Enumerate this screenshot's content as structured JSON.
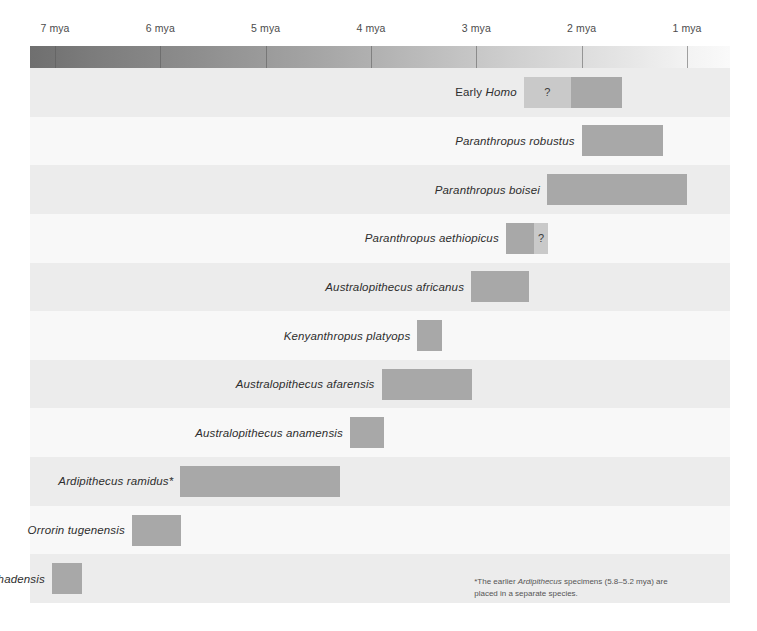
{
  "chart_data": {
    "type": "bar",
    "xlabel": "Millions of years ago (mya)",
    "ylabel": "",
    "xlim": [
      7.25,
      0.75
    ],
    "x_direction": "decreasing",
    "grid": true,
    "legend": "none",
    "axis_ticks": [
      {
        "value": 7,
        "label": "7 mya"
      },
      {
        "value": 6,
        "label": "6 mya"
      },
      {
        "value": 5,
        "label": "5 mya"
      },
      {
        "value": 4,
        "label": "4 mya"
      },
      {
        "value": 3,
        "label": "3 mya"
      },
      {
        "value": 2,
        "label": "2 mya"
      },
      {
        "value": 1,
        "label": "1 mya"
      }
    ],
    "series": [
      {
        "name": "Early Homo",
        "label_prefix": "Early ",
        "label_italic": "Homo",
        "label_full": "Early Homo",
        "label_align": "right-of-label",
        "ranges": [
          {
            "start": 2.55,
            "end": 2.1,
            "uncertain": true,
            "marker": "?"
          },
          {
            "start": 2.1,
            "end": 1.62,
            "uncertain": false,
            "marker": ""
          }
        ]
      },
      {
        "name": "Paranthropus robustus",
        "label_prefix": "",
        "label_italic": "Paranthropus robustus",
        "label_full": "Paranthropus robustus",
        "ranges": [
          {
            "start": 2.0,
            "end": 1.23,
            "uncertain": false,
            "marker": ""
          }
        ]
      },
      {
        "name": "Paranthropus boisei",
        "label_prefix": "",
        "label_italic": "Paranthropus boisei",
        "label_full": "Paranthropus boisei",
        "ranges": [
          {
            "start": 2.33,
            "end": 1.0,
            "uncertain": false,
            "marker": ""
          }
        ]
      },
      {
        "name": "Paranthropus aethiopicus",
        "label_prefix": "",
        "label_italic": "Paranthropus aethiopicus",
        "label_full": "Paranthropus aethiopicus",
        "ranges": [
          {
            "start": 2.72,
            "end": 2.45,
            "uncertain": false,
            "marker": ""
          },
          {
            "start": 2.45,
            "end": 2.32,
            "uncertain": true,
            "marker": "?"
          }
        ]
      },
      {
        "name": "Australopithecus africanus",
        "label_prefix": "",
        "label_italic": "Australopithecus africanus",
        "label_full": "Australopithecus africanus",
        "ranges": [
          {
            "start": 3.05,
            "end": 2.5,
            "uncertain": false,
            "marker": ""
          }
        ]
      },
      {
        "name": "Kenyanthropus platyops",
        "label_prefix": "",
        "label_italic": "Kenyanthropus platyops",
        "label_full": "Kenyanthropus platyops",
        "ranges": [
          {
            "start": 3.56,
            "end": 3.33,
            "uncertain": false,
            "marker": ""
          }
        ]
      },
      {
        "name": "Australopithecus afarensis",
        "label_prefix": "",
        "label_italic": "Australopithecus afarensis",
        "label_full": "Australopithecus afarensis",
        "ranges": [
          {
            "start": 3.9,
            "end": 3.04,
            "uncertain": false,
            "marker": ""
          }
        ]
      },
      {
        "name": "Australopithecus anamensis",
        "label_prefix": "",
        "label_italic": "Australopithecus anamensis",
        "label_full": "Australopithecus anamensis",
        "ranges": [
          {
            "start": 4.2,
            "end": 3.88,
            "uncertain": false,
            "marker": ""
          }
        ]
      },
      {
        "name": "Ardipithecus ramidus*",
        "label_prefix": "",
        "label_italic": "Ardipithecus ramidus*",
        "label_full": "Ardipithecus ramidus*",
        "ranges": [
          {
            "start": 5.81,
            "end": 4.29,
            "uncertain": false,
            "marker": ""
          }
        ]
      },
      {
        "name": "Orrorin tugenensis",
        "label_prefix": "",
        "label_italic": "Orrorin tugenensis",
        "label_full": "Orrorin tugenensis",
        "ranges": [
          {
            "start": 6.27,
            "end": 5.8,
            "uncertain": false,
            "marker": ""
          }
        ]
      },
      {
        "name": "Sahelanthropus tchadensis",
        "label_prefix": "",
        "label_italic": "Sahelanthropus tchadensis",
        "label_full": "Sahelanthropus tchadensis",
        "ranges": [
          {
            "start": 7.03,
            "end": 6.74,
            "uncertain": false,
            "marker": ""
          }
        ]
      }
    ],
    "annotations": [
      {
        "id": "ardipithecus-footnote",
        "text_before": "*The earlier ",
        "text_italic": "Ardipithecus",
        "text_after": " specimens (5.8–5.2 mya) are placed in a separate species."
      }
    ],
    "colors": {
      "bar": "#a8a8a8",
      "bar_uncertain": "#c9c9c9",
      "row_alt": "#ececec",
      "row_plain": "#f8f8f8",
      "gridline": "#dadada",
      "label_text": "#2e2e2e",
      "axis_text": "#4c4c4c",
      "footnote_text": "#555555",
      "gradient_dark": "#6f6f6f",
      "gradient_light": "#fafafa"
    }
  },
  "footnote": {
    "marker": "*",
    "line1_before": "*The earlier ",
    "line1_italic": "Ardipithecus",
    "line1_after": " specimens (5.8–5.2 mya) are placed",
    "line2": "in a separate species."
  }
}
